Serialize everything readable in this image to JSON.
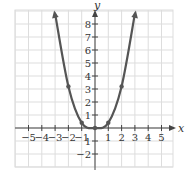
{
  "chart_data": {
    "type": "line",
    "title": "",
    "xlabel": "x",
    "ylabel": "y",
    "xlim": [
      -6,
      6
    ],
    "ylim": [
      -3,
      9
    ],
    "grid": true,
    "x_ticks": [
      -5,
      -4,
      -3,
      -2,
      -1,
      1,
      2,
      3,
      4,
      5
    ],
    "x_tick_labels": [
      "−5",
      "−4",
      "−3",
      "−2",
      "−1",
      "1",
      "2",
      "3",
      "4",
      "5"
    ],
    "y_ticks": [
      -2,
      -1,
      1,
      2,
      3,
      4,
      5,
      6,
      7,
      8
    ],
    "y_tick_labels": [
      "−2",
      "1",
      "1",
      "2",
      "3",
      "4",
      "5",
      "6",
      "7",
      "8"
    ],
    "series": [
      {
        "name": "curve",
        "x": [
          -3,
          -2,
          -1,
          0,
          1,
          2,
          3
        ],
        "y": [
          8.8,
          3.2,
          0.4,
          0,
          0.4,
          3.2,
          8.8
        ],
        "marked_points": [
          {
            "x": -2,
            "y": 3.2
          },
          {
            "x": -1,
            "y": 0.4
          },
          {
            "x": 0,
            "y": 0
          },
          {
            "x": 1,
            "y": 0.4
          },
          {
            "x": 2,
            "y": 3.2
          }
        ],
        "arrows_at_ends": true
      }
    ]
  },
  "colors": {
    "curve": "#555555",
    "axis": "#444444",
    "grid": "#dddddd",
    "text": "#333333"
  }
}
